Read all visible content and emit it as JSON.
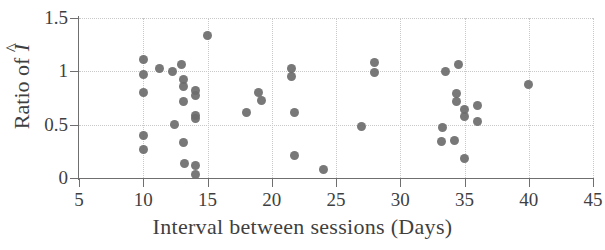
{
  "chart_data": {
    "type": "scatter",
    "title": "",
    "xlabel": "Interval between sessions (Days)",
    "ylabel_prefix": "Ratio of ",
    "ylabel_symbol": "I",
    "ylabel_accent": "^",
    "ylabel": "Ratio of Î",
    "xlim": [
      5,
      45
    ],
    "ylim": [
      0,
      1.5
    ],
    "xticks": [
      5,
      10,
      15,
      20,
      25,
      30,
      35,
      40,
      45
    ],
    "xtick_labels": [
      "5",
      "10",
      "15",
      "20",
      "25",
      "30",
      "35",
      "40",
      "45"
    ],
    "yticks": [
      0,
      0.5,
      1,
      1.5
    ],
    "ytick_labels": [
      "0",
      "0.5",
      "1",
      "1.5"
    ],
    "grid": true,
    "grid_style": "dotted",
    "grid_color": "#c9c9c9",
    "marker": "circle",
    "marker_color": "#6d6d6d",
    "marker_size": 9,
    "legend": null,
    "points": [
      {
        "x": 10.0,
        "y": 1.11
      },
      {
        "x": 10.0,
        "y": 0.97
      },
      {
        "x": 10.0,
        "y": 0.8
      },
      {
        "x": 10.0,
        "y": 0.4
      },
      {
        "x": 10.0,
        "y": 0.27
      },
      {
        "x": 11.3,
        "y": 1.03
      },
      {
        "x": 12.3,
        "y": 1.0
      },
      {
        "x": 13.0,
        "y": 1.06
      },
      {
        "x": 13.1,
        "y": 0.92
      },
      {
        "x": 13.1,
        "y": 0.86
      },
      {
        "x": 13.1,
        "y": 0.72
      },
      {
        "x": 12.4,
        "y": 0.5
      },
      {
        "x": 13.1,
        "y": 0.33
      },
      {
        "x": 13.2,
        "y": 0.14
      },
      {
        "x": 14.1,
        "y": 0.82
      },
      {
        "x": 14.1,
        "y": 0.77
      },
      {
        "x": 14.1,
        "y": 0.59
      },
      {
        "x": 14.1,
        "y": 0.56
      },
      {
        "x": 14.1,
        "y": 0.12
      },
      {
        "x": 14.1,
        "y": 0.03
      },
      {
        "x": 15.0,
        "y": 1.34
      },
      {
        "x": 18.0,
        "y": 0.61
      },
      {
        "x": 19.0,
        "y": 0.8
      },
      {
        "x": 19.2,
        "y": 0.73
      },
      {
        "x": 21.5,
        "y": 1.03
      },
      {
        "x": 21.5,
        "y": 0.95
      },
      {
        "x": 21.8,
        "y": 0.61
      },
      {
        "x": 21.8,
        "y": 0.21
      },
      {
        "x": 24.0,
        "y": 0.08
      },
      {
        "x": 27.0,
        "y": 0.48
      },
      {
        "x": 28.0,
        "y": 1.08
      },
      {
        "x": 28.0,
        "y": 0.99
      },
      {
        "x": 33.5,
        "y": 1.0
      },
      {
        "x": 34.5,
        "y": 1.06
      },
      {
        "x": 34.4,
        "y": 0.79
      },
      {
        "x": 34.4,
        "y": 0.72
      },
      {
        "x": 35.0,
        "y": 0.64
      },
      {
        "x": 35.0,
        "y": 0.58
      },
      {
        "x": 36.0,
        "y": 0.68
      },
      {
        "x": 36.0,
        "y": 0.53
      },
      {
        "x": 33.3,
        "y": 0.47
      },
      {
        "x": 33.2,
        "y": 0.34
      },
      {
        "x": 34.2,
        "y": 0.35
      },
      {
        "x": 35.0,
        "y": 0.18
      },
      {
        "x": 40.0,
        "y": 0.88
      }
    ]
  }
}
